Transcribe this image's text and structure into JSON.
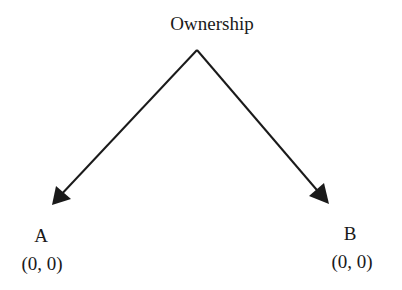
{
  "diagram": {
    "root": {
      "label": "Ownership"
    },
    "children": [
      {
        "name": "A",
        "payoff": "(0, 0)"
      },
      {
        "name": "B",
        "payoff": "(0, 0)"
      }
    ],
    "colors": {
      "line": "#1a1a1a",
      "background": "#ffffff"
    }
  }
}
